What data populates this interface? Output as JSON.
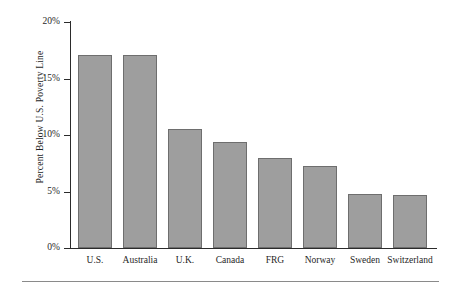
{
  "chart_data": {
    "type": "bar",
    "title": "",
    "xlabel": "",
    "ylabel": "Percent Below U.S. Poverty Line",
    "categories": [
      "U.S.",
      "Australia",
      "U.K.",
      "Canada",
      "FRG",
      "Norway",
      "Sweden",
      "Switzerland"
    ],
    "values": [
      17.1,
      17.1,
      10.5,
      9.4,
      8.0,
      7.3,
      4.8,
      4.7
    ],
    "ylim": [
      0,
      20
    ],
    "ytick_values": [
      0,
      5,
      10,
      15,
      20
    ],
    "ytick_labels": [
      "0%",
      "5%",
      "10%",
      "15%",
      "20%"
    ],
    "grid": false,
    "legend": "none",
    "bar_color": "#9e9e9e",
    "bar_edge_color": "#6e6e6e",
    "axis_color": "#2b2b2b",
    "background": "#ffffff"
  }
}
